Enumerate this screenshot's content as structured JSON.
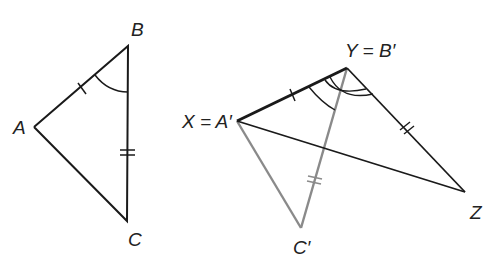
{
  "figure": {
    "left_triangle": {
      "labels": {
        "A": "A",
        "B": "B",
        "C": "C"
      },
      "points": {
        "A": [
          34,
          127
        ],
        "B": [
          128,
          46
        ],
        "C": [
          127,
          221
        ]
      },
      "marks": {
        "AB": "single tick",
        "BC": "double tick",
        "angle_B": "single arc"
      }
    },
    "right_figure": {
      "labels": {
        "X": "X = A′",
        "Y": "Y = B′",
        "Z": "Z",
        "C": "C′"
      },
      "points": {
        "X": [
          237,
          121
        ],
        "Y": [
          347,
          68
        ],
        "Z": [
          465,
          192
        ],
        "C": [
          301,
          228
        ]
      },
      "marks": {
        "XY": "single tick",
        "YZ": "double tick",
        "YC": "double tick",
        "angle_Y": "single and double arcs"
      }
    },
    "colors": {
      "black_lines": "#1a1a1a",
      "gray_lines": "#8a8a8a"
    }
  }
}
